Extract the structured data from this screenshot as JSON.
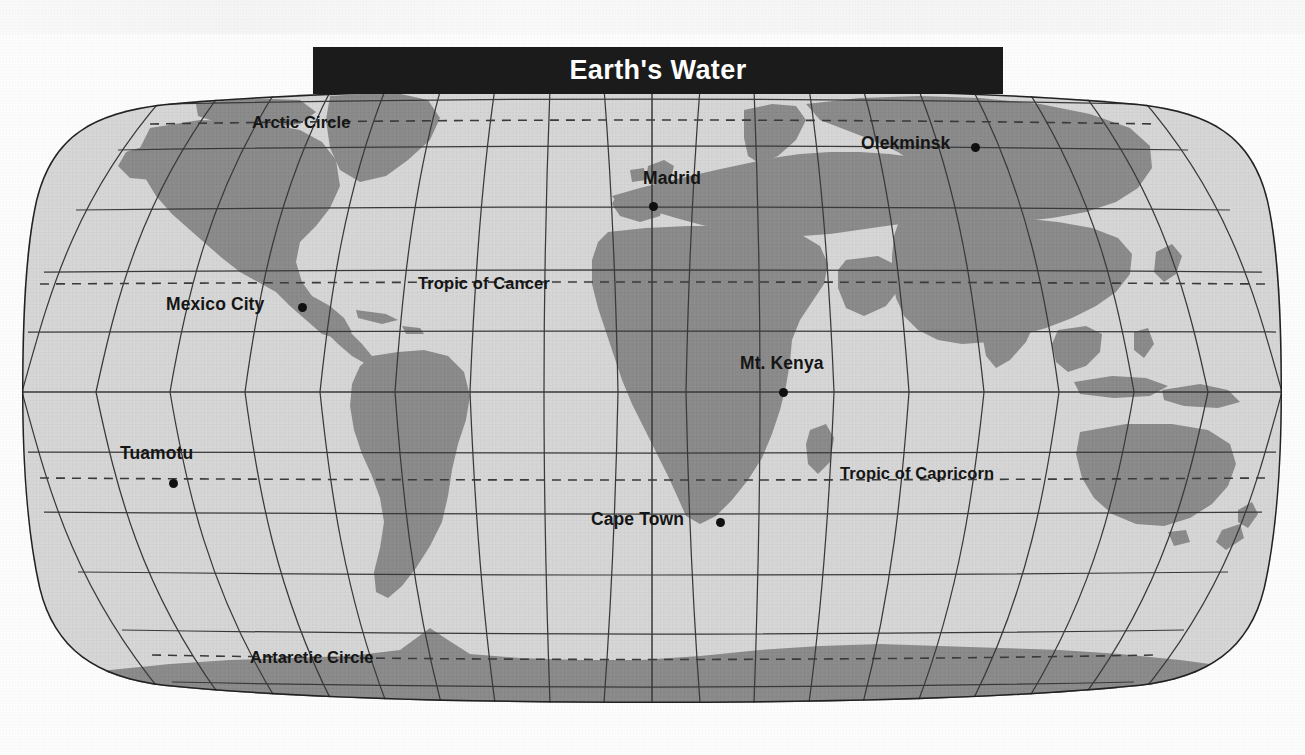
{
  "page": {
    "width": 1305,
    "height": 755,
    "background": "#fdfdfd"
  },
  "title": {
    "text": "Earth's Water",
    "banner_color": "#1b1b1b",
    "text_color": "#ffffff"
  },
  "map": {
    "projection": "robinson",
    "ocean_color": "#d6d6d6",
    "land_color": "#8b8b8b",
    "graticule_color": "#3a3a3a",
    "outline_color": "#222222",
    "dashed_line_color": "#404040",
    "latitude_lines": [
      {
        "name": "Arctic Circle",
        "label": "Arctic Circle",
        "style": "dashed"
      },
      {
        "name": "Tropic of Cancer",
        "label": "Tropic of Cancer",
        "style": "dashed"
      },
      {
        "name": "Equator",
        "label": "",
        "style": "solid"
      },
      {
        "name": "Tropic of Capricorn",
        "label": "Tropic of Capricorn",
        "style": "dashed"
      },
      {
        "name": "Antarctic Circle",
        "label": "Antarctic Circle",
        "style": "dashed"
      }
    ],
    "labels": [
      {
        "id": "arctic-circle",
        "text": "Arctic Circle",
        "x": 252,
        "y": 113,
        "type": "latitude"
      },
      {
        "id": "tropic-of-cancer",
        "text": "Tropic of Cancer",
        "x": 418,
        "y": 274,
        "type": "latitude"
      },
      {
        "id": "tropic-of-capricorn",
        "text": "Tropic of Capricorn",
        "x": 840,
        "y": 464,
        "type": "latitude"
      },
      {
        "id": "antarctic-circle",
        "text": "Antarctic Circle",
        "x": 250,
        "y": 648,
        "type": "latitude"
      }
    ],
    "cities": [
      {
        "id": "olekminsk",
        "name": "Olekminsk",
        "label_x": 861,
        "label_y": 133,
        "dot_x": 971,
        "dot_y": 143,
        "dot_position": "after"
      },
      {
        "id": "madrid",
        "name": "Madrid",
        "label_x": 643,
        "label_y": 168,
        "dot_x": 649,
        "dot_y": 202,
        "dot_position": "below"
      },
      {
        "id": "mexico-city",
        "name": "Mexico City",
        "label_x": 166,
        "label_y": 294,
        "dot_x": 298,
        "dot_y": 303,
        "dot_position": "after"
      },
      {
        "id": "mt-kenya",
        "name": "Mt. Kenya",
        "label_x": 740,
        "label_y": 353,
        "dot_x": 779,
        "dot_y": 388,
        "dot_position": "below"
      },
      {
        "id": "tuamotu",
        "name": "Tuamotu",
        "label_x": 120,
        "label_y": 443,
        "dot_x": 169,
        "dot_y": 479,
        "dot_position": "below"
      },
      {
        "id": "cape-town",
        "name": "Cape Town",
        "label_x": 591,
        "label_y": 509,
        "dot_x": 716,
        "dot_y": 518,
        "dot_position": "after"
      }
    ]
  }
}
